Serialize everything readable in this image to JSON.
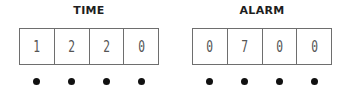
{
  "time": {
    "title": "TIME",
    "digits": [
      "1",
      "2",
      "2",
      "0"
    ]
  },
  "alarm": {
    "title": "ALARM",
    "digits": [
      "0",
      "7",
      "0",
      "0"
    ]
  },
  "colors": {
    "border": "#6e6e6e",
    "digit": "#555555",
    "dot": "#111111",
    "title": "#1e1e1e"
  }
}
